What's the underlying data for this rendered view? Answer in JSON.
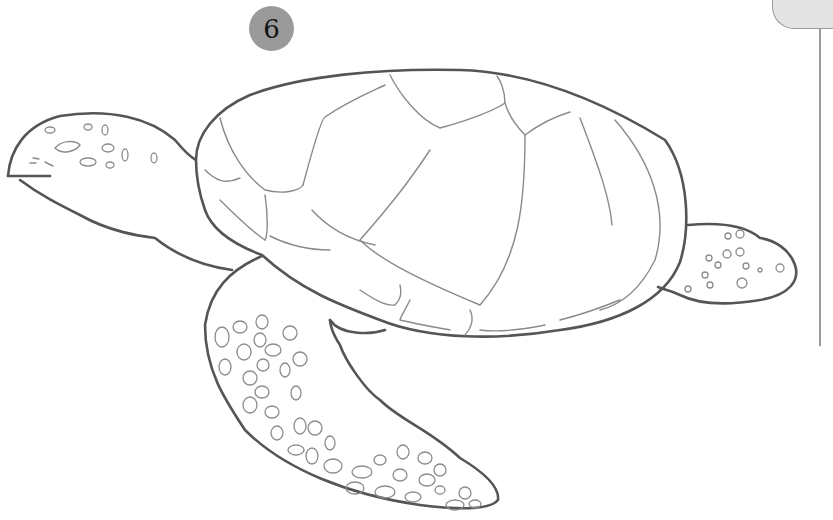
{
  "illustration": {
    "subject": "sea turtle line drawing",
    "step_number": "6",
    "colors": {
      "badge": "#9a9a9a",
      "outline": "#555555",
      "detail": "#8a8a8a",
      "panel": "#e4e4e4"
    }
  }
}
